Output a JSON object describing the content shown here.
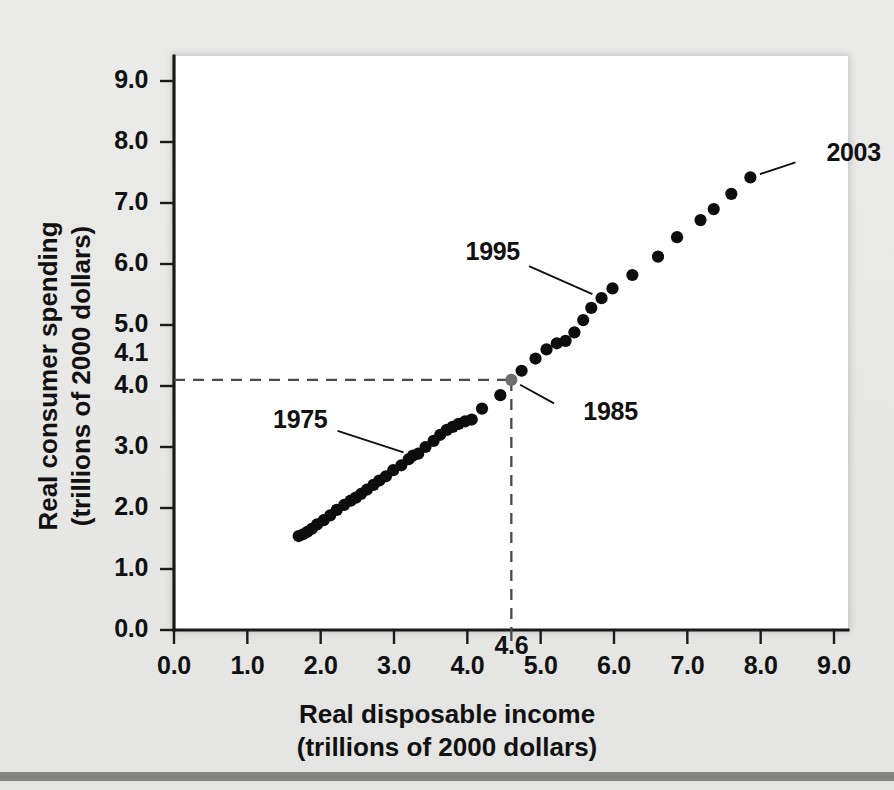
{
  "chart_data": {
    "type": "scatter",
    "title": "",
    "xlabel": "Real disposable income (trillions of 2000 dollars)",
    "xlabel_line1": "Real disposable income",
    "xlabel_line2": "(trillions of 2000 dollars)",
    "ylabel": "Real consumer spending (trillions of 2000 dollars)",
    "ylabel_line1": "Real consumer spending",
    "ylabel_line2": "(trillions of 2000 dollars)",
    "xlim": [
      0.0,
      9.0
    ],
    "ylim": [
      0.0,
      9.0
    ],
    "grid": false,
    "legend": "none",
    "x_ticks": [
      "0.0",
      "1.0",
      "2.0",
      "3.0",
      "4.0",
      "5.0",
      "6.0",
      "7.0",
      "8.0",
      "9.0"
    ],
    "x_tick_values": [
      0.0,
      1.0,
      2.0,
      3.0,
      4.0,
      5.0,
      6.0,
      7.0,
      8.0,
      9.0
    ],
    "y_ticks": [
      "0.0",
      "1.0",
      "2.0",
      "3.0",
      "4.0",
      "5.0",
      "6.0",
      "7.0",
      "8.0",
      "9.0"
    ],
    "y_tick_values": [
      0.0,
      1.0,
      2.0,
      3.0,
      4.0,
      5.0,
      6.0,
      7.0,
      8.0,
      9.0
    ],
    "x_special_tick": {
      "label": "4.6",
      "value": 4.6
    },
    "y_special_tick": {
      "label": "4.1",
      "value": 4.1
    },
    "reference_lines": {
      "horizontal_y": 4.1,
      "vertical_x": 4.6,
      "style": "dashed",
      "color": "#4a4a4a"
    },
    "series_name": "Consumption function",
    "point_color": "#0d0d0d",
    "points": [
      {
        "x": 1.7,
        "y": 1.54
      },
      {
        "x": 1.76,
        "y": 1.57
      },
      {
        "x": 1.82,
        "y": 1.61
      },
      {
        "x": 1.88,
        "y": 1.66
      },
      {
        "x": 1.95,
        "y": 1.73
      },
      {
        "x": 2.04,
        "y": 1.8
      },
      {
        "x": 2.13,
        "y": 1.88
      },
      {
        "x": 2.22,
        "y": 1.97
      },
      {
        "x": 2.32,
        "y": 2.05
      },
      {
        "x": 2.41,
        "y": 2.12
      },
      {
        "x": 2.48,
        "y": 2.17
      },
      {
        "x": 2.55,
        "y": 2.23
      },
      {
        "x": 2.63,
        "y": 2.3
      },
      {
        "x": 2.72,
        "y": 2.38
      },
      {
        "x": 2.8,
        "y": 2.45
      },
      {
        "x": 2.89,
        "y": 2.52
      },
      {
        "x": 2.99,
        "y": 2.62
      },
      {
        "x": 3.1,
        "y": 2.7
      },
      {
        "x": 3.2,
        "y": 2.8
      },
      {
        "x": 3.26,
        "y": 2.86
      },
      {
        "x": 3.33,
        "y": 2.89
      },
      {
        "x": 3.43,
        "y": 3.0
      },
      {
        "x": 3.54,
        "y": 3.1
      },
      {
        "x": 3.63,
        "y": 3.2
      },
      {
        "x": 3.72,
        "y": 3.28
      },
      {
        "x": 3.8,
        "y": 3.33
      },
      {
        "x": 3.88,
        "y": 3.38
      },
      {
        "x": 3.97,
        "y": 3.42
      },
      {
        "x": 4.06,
        "y": 3.45
      },
      {
        "x": 4.2,
        "y": 3.63
      },
      {
        "x": 4.45,
        "y": 3.85
      },
      {
        "x": 4.6,
        "y": 4.1
      },
      {
        "x": 4.74,
        "y": 4.25
      },
      {
        "x": 4.93,
        "y": 4.45
      },
      {
        "x": 5.08,
        "y": 4.6
      },
      {
        "x": 5.22,
        "y": 4.7
      },
      {
        "x": 5.34,
        "y": 4.74
      },
      {
        "x": 5.46,
        "y": 4.88
      },
      {
        "x": 5.58,
        "y": 5.08
      },
      {
        "x": 5.69,
        "y": 5.28
      },
      {
        "x": 5.83,
        "y": 5.44
      },
      {
        "x": 5.98,
        "y": 5.6
      },
      {
        "x": 6.25,
        "y": 5.82
      },
      {
        "x": 6.6,
        "y": 6.12
      },
      {
        "x": 6.86,
        "y": 6.44
      },
      {
        "x": 7.18,
        "y": 6.72
      },
      {
        "x": 7.36,
        "y": 6.9
      },
      {
        "x": 7.6,
        "y": 7.15
      },
      {
        "x": 7.86,
        "y": 7.42
      }
    ],
    "annotations": [
      {
        "label": "1975",
        "point_x": 3.26,
        "point_y": 2.86,
        "text_anchor": "right"
      },
      {
        "label": "1985",
        "point_x": 4.6,
        "point_y": 4.1,
        "text_anchor": "left"
      },
      {
        "label": "1995",
        "point_x": 5.83,
        "point_y": 5.44,
        "text_anchor": "right"
      },
      {
        "label": "2003",
        "point_x": 7.86,
        "point_y": 7.42,
        "text_anchor": "left"
      }
    ]
  }
}
